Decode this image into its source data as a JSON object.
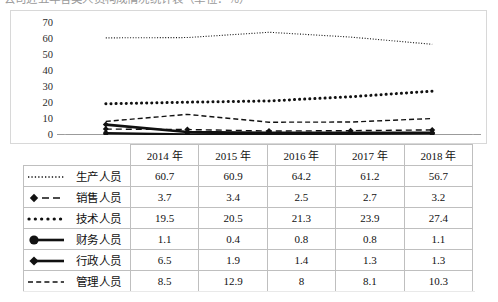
{
  "caption": {
    "text": "公司近五年各类人员构成情况统计表（单位：％）"
  },
  "chart_data": {
    "type": "line",
    "title": "",
    "xlabel": "",
    "ylabel": "",
    "ylim": [
      0,
      70
    ],
    "ytick_step": 10,
    "yticks": [
      "70",
      "60",
      "50",
      "40",
      "30",
      "20",
      "10",
      "0"
    ],
    "grid": false,
    "legend": "table-row-labels",
    "categories": [
      "2014 年",
      "2015 年",
      "2016 年",
      "2017 年",
      "2018 年"
    ],
    "series": [
      {
        "name": "生产人员",
        "style": "fine-dotted",
        "marker": "none",
        "values": [
          60.7,
          60.9,
          64.2,
          61.2,
          56.7
        ]
      },
      {
        "name": "销售人员",
        "style": "dash-diamond",
        "marker": "diamond",
        "values": [
          3.7,
          3.4,
          2.5,
          2.7,
          3.2
        ]
      },
      {
        "name": "技术人员",
        "style": "bold-dotted",
        "marker": "none",
        "values": [
          19.5,
          20.5,
          21.3,
          23.9,
          27.4
        ]
      },
      {
        "name": "财务人员",
        "style": "solid-circle",
        "marker": "circle",
        "values": [
          1.1,
          0.4,
          0.8,
          0.8,
          1.1
        ]
      },
      {
        "name": "行政人员",
        "style": "solid-diamond",
        "marker": "diamond",
        "values": [
          6.5,
          1.9,
          1.4,
          1.3,
          1.3
        ]
      },
      {
        "name": "管理人员",
        "style": "dashed",
        "marker": "none",
        "values": [
          8.5,
          12.9,
          8,
          8.1,
          10.3
        ]
      }
    ]
  },
  "table": {
    "corner_label": "",
    "headers": [
      "2014 年",
      "2015 年",
      "2016 年",
      "2017 年",
      "2018 年"
    ],
    "rows": [
      {
        "label": "生产人员",
        "icon": "fine-dotted-line-icon",
        "cells": [
          "60.7",
          "60.9",
          "64.2",
          "61.2",
          "56.7"
        ]
      },
      {
        "label": "销售人员",
        "icon": "diamond-dashed-line-icon",
        "cells": [
          "3.7",
          "3.4",
          "2.5",
          "2.7",
          "3.2"
        ]
      },
      {
        "label": "技术人员",
        "icon": "bold-dotted-line-icon",
        "cells": [
          "19.5",
          "20.5",
          "21.3",
          "23.9",
          "27.4"
        ]
      },
      {
        "label": "财务人员",
        "icon": "circle-solid-line-icon",
        "cells": [
          "1.1",
          "0.4",
          "0.8",
          "0.8",
          "1.1"
        ]
      },
      {
        "label": "行政人员",
        "icon": "diamond-solid-line-icon",
        "cells": [
          "6.5",
          "1.9",
          "1.4",
          "1.3",
          "1.3"
        ]
      },
      {
        "label": "管理人员",
        "icon": "dashed-line-icon",
        "cells": [
          "8.5",
          "12.9",
          "8",
          "8.1",
          "10.3"
        ]
      }
    ]
  },
  "colors": {
    "ink": "#111111",
    "frame": "#d8d8d8",
    "table_border": "#bfbfbf",
    "background": "#ffffff"
  }
}
